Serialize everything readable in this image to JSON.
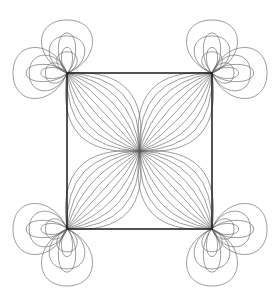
{
  "figure": {
    "type": "line-diagram",
    "canvas": {
      "width": 279,
      "height": 306,
      "background": "#ffffff"
    },
    "colors": {
      "square_stroke": "#1a1a1a",
      "curve_stroke": "#5a5a5a",
      "background": "#ffffff"
    },
    "stroke_widths": {
      "square": 1.5,
      "curve": 0.6
    },
    "square": {
      "name": "bounding-square",
      "left": 67,
      "top": 73,
      "right": 212,
      "bottom": 229,
      "width": 145,
      "height": 156,
      "corners": [
        {
          "label": "top-left",
          "x": 67,
          "y": 73
        },
        {
          "label": "top-right",
          "x": 212,
          "y": 73
        },
        {
          "label": "bottom-right",
          "x": 212,
          "y": 229
        },
        {
          "label": "bottom-left",
          "x": 67,
          "y": 229
        }
      ]
    },
    "center": {
      "name": "convergence-point",
      "x": 139.5,
      "y": 151
    },
    "curve_family": {
      "curves_per_fan": 11,
      "fans": 4,
      "description": "Arc families joining each square corner to the centre"
    },
    "petals": {
      "count_per_corner": 3,
      "directions": [
        "up",
        "down",
        "left",
        "right"
      ],
      "extents": {
        "top": 20,
        "bottom": 286,
        "left": 13,
        "right": 267
      }
    },
    "chart_data": {
      "type": "line",
      "title": "Geometric curve rosette on square",
      "xlabel": "",
      "ylabel": "",
      "xlim": [
        0,
        279
      ],
      "ylim": [
        0,
        306
      ],
      "grid": false,
      "legend": "none"
    }
  }
}
